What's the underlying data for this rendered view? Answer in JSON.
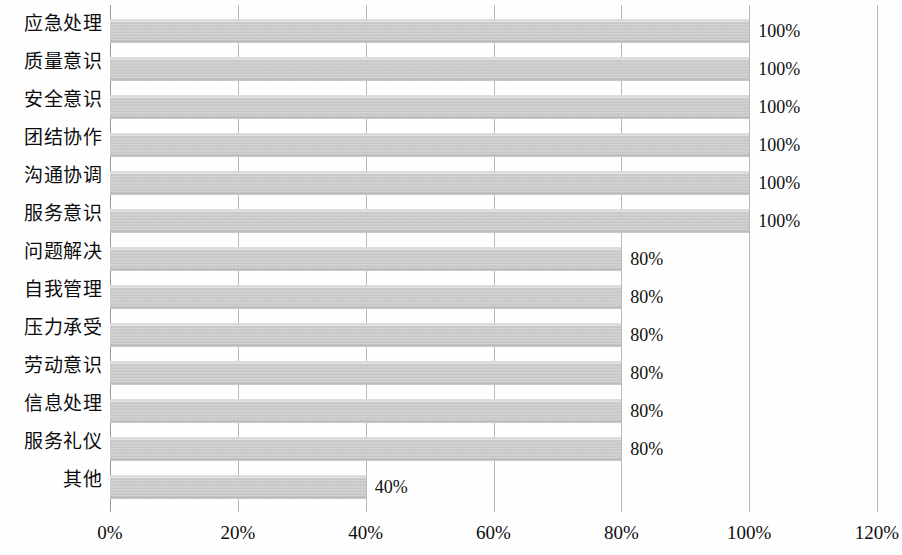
{
  "chart_data": {
    "type": "bar",
    "orientation": "horizontal",
    "title": "",
    "xlabel": "",
    "ylabel": "",
    "xlim": [
      0,
      120
    ],
    "xticks": [
      "0%",
      "20%",
      "40%",
      "60%",
      "80%",
      "100%",
      "120%"
    ],
    "xtick_values": [
      0,
      20,
      40,
      60,
      80,
      100,
      120
    ],
    "grid": true,
    "legend": "none",
    "categories": [
      "应急处理",
      "质量意识",
      "安全意识",
      "团结协作",
      "沟通协调",
      "服务意识",
      "问题解决",
      "自我管理",
      "压力承受",
      "劳动意识",
      "信息处理",
      "服务礼仪",
      "其他"
    ],
    "values": [
      100,
      100,
      100,
      100,
      100,
      100,
      80,
      80,
      80,
      80,
      80,
      80,
      40
    ],
    "data_labels": [
      "100%",
      "100%",
      "100%",
      "100%",
      "100%",
      "100%",
      "80%",
      "80%",
      "80%",
      "80%",
      "80%",
      "80%",
      "40%"
    ],
    "bar_color": "#c9c9c9",
    "gridline_color": "#b9b9b9"
  }
}
